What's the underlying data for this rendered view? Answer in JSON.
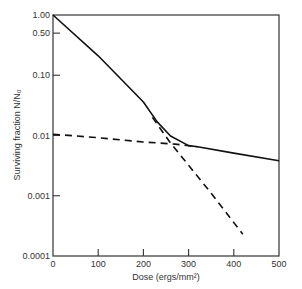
{
  "chart_data": {
    "type": "line",
    "title": "",
    "xlabel": "Dose (ergs/mm²)",
    "ylabel": "Surviving fraction N/N₀",
    "xscale": "linear",
    "yscale": "log",
    "xlim": [
      0,
      500
    ],
    "ylim": [
      0.0001,
      1.0
    ],
    "grid": false,
    "legend": null,
    "x_ticks": [
      0,
      100,
      200,
      300,
      400,
      500
    ],
    "x_tick_labels": [
      "0",
      "100",
      "200",
      "300",
      "400",
      "500"
    ],
    "y_ticks": [
      1.0,
      0.5,
      0.1,
      0.01,
      0.001,
      0.0001
    ],
    "y_tick_labels": [
      "1.00",
      "0.50",
      "0.10",
      "0.01",
      "0.001",
      "0.0001"
    ],
    "series": [
      {
        "name": "Observed survival curve",
        "style": "solid",
        "points": [
          [
            0,
            1.0
          ],
          [
            100,
            0.21
          ],
          [
            200,
            0.036
          ],
          [
            230,
            0.017
          ],
          [
            260,
            0.0098
          ],
          [
            300,
            0.0068
          ],
          [
            320,
            0.0065
          ],
          [
            400,
            0.0051
          ],
          [
            500,
            0.0038
          ]
        ]
      },
      {
        "name": "Resistant component extrapolation",
        "style": "dashed",
        "points": [
          [
            0,
            0.0105
          ],
          [
            100,
            0.0092
          ],
          [
            200,
            0.0078
          ],
          [
            270,
            0.0072
          ],
          [
            320,
            0.0065
          ]
        ]
      },
      {
        "name": "Sensitive component extrapolation",
        "style": "dashed",
        "points": [
          [
            220,
            0.02
          ],
          [
            260,
            0.0075
          ],
          [
            300,
            0.0032
          ],
          [
            350,
            0.0011
          ],
          [
            420,
            0.00023
          ]
        ]
      }
    ]
  }
}
